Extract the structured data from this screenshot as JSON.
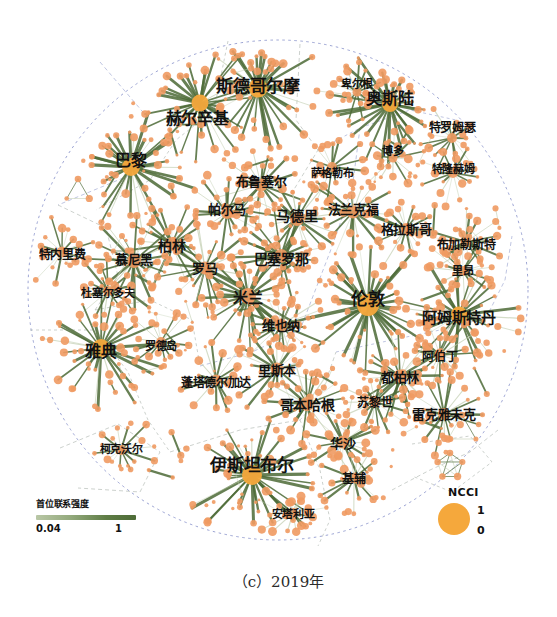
{
  "figure": {
    "caption": "（c）2019年",
    "circle": {
      "cx": 278,
      "cy": 290,
      "r": 250
    },
    "colors": {
      "node": "#ef9a62",
      "node_strong": "#f5a83c",
      "edge_strong": "#4d6b37",
      "edge_weak": "#c3cfb2",
      "boundary": "#7b86c4",
      "label": "#111111"
    }
  },
  "legend_edge": {
    "title": "首位联系强度",
    "min": "0.04",
    "max": "1"
  },
  "legend_node": {
    "title": "NCCI",
    "max": "1",
    "min": "0"
  },
  "chart_data": {
    "type": "scatter",
    "title": "（c）2019年",
    "xlabel": "",
    "ylabel": "",
    "grid": false,
    "legend_position": "bottom-left-and-bottom-right",
    "series": [
      {
        "name": "cities",
        "nodes": [
          {
            "label": "斯德哥尔摩",
            "x": 258,
            "y": 88,
            "r": 9.5,
            "ncci": 0.95,
            "lx": 258,
            "ly": 84
          },
          {
            "label": "赫尔辛基",
            "x": 200,
            "y": 103,
            "r": 8.5,
            "ncci": 0.88,
            "lx": 197,
            "ly": 117
          },
          {
            "label": "奥斯陆",
            "x": 390,
            "y": 104,
            "r": 8.0,
            "ncci": 0.85,
            "lx": 390,
            "ly": 97
          },
          {
            "label": "卑尔根",
            "x": 357,
            "y": 92,
            "r": 4.5,
            "ncci": 0.35,
            "lx": 357,
            "ly": 83
          },
          {
            "label": "特罗姆瑟",
            "x": 452,
            "y": 138,
            "r": 5.0,
            "ncci": 0.4,
            "lx": 452,
            "ly": 126
          },
          {
            "label": "博多",
            "x": 393,
            "y": 158,
            "r": 4.5,
            "ncci": 0.32,
            "lx": 393,
            "ly": 150
          },
          {
            "label": "特隆赫姆",
            "x": 453,
            "y": 173,
            "r": 5.0,
            "ncci": 0.38,
            "lx": 453,
            "ly": 168
          },
          {
            "label": "萨格勒布",
            "x": 332,
            "y": 167,
            "r": 5.0,
            "ncci": 0.38,
            "lx": 332,
            "ly": 172
          },
          {
            "label": "巴黎",
            "x": 131,
            "y": 167,
            "r": 9.0,
            "ncci": 0.92,
            "lx": 131,
            "ly": 159
          },
          {
            "label": "布鲁塞尔",
            "x": 261,
            "y": 185,
            "r": 6.5,
            "ncci": 0.55,
            "lx": 261,
            "ly": 180
          },
          {
            "label": "帕尔马",
            "x": 227,
            "y": 213,
            "r": 6.0,
            "ncci": 0.5,
            "lx": 227,
            "ly": 208
          },
          {
            "label": "马德里",
            "x": 297,
            "y": 219,
            "r": 7.0,
            "ncci": 0.65,
            "lx": 297,
            "ly": 215
          },
          {
            "label": "法兰克福",
            "x": 353,
            "y": 212,
            "r": 6.5,
            "ncci": 0.58,
            "lx": 353,
            "ly": 208
          },
          {
            "label": "格拉斯哥",
            "x": 406,
            "y": 229,
            "r": 6.0,
            "ncci": 0.5,
            "lx": 406,
            "ly": 228
          },
          {
            "label": "布加勒斯特",
            "x": 466,
            "y": 242,
            "r": 5.5,
            "ncci": 0.45,
            "lx": 466,
            "ly": 243
          },
          {
            "label": "柏林",
            "x": 172,
            "y": 244,
            "r": 7.0,
            "ncci": 0.62,
            "lx": 172,
            "ly": 245
          },
          {
            "label": "特内里费",
            "x": 62,
            "y": 252,
            "r": 5.5,
            "ncci": 0.42,
            "lx": 62,
            "ly": 253
          },
          {
            "label": "慕尼黑",
            "x": 134,
            "y": 261,
            "r": 7.0,
            "ncci": 0.6,
            "lx": 134,
            "ly": 258
          },
          {
            "label": "罗马",
            "x": 205,
            "y": 268,
            "r": 6.5,
            "ncci": 0.58,
            "lx": 205,
            "ly": 267
          },
          {
            "label": "巴塞罗那",
            "x": 281,
            "y": 256,
            "r": 7.0,
            "ncci": 0.62,
            "lx": 281,
            "ly": 258
          },
          {
            "label": "里昂",
            "x": 463,
            "y": 271,
            "r": 5.0,
            "ncci": 0.38,
            "lx": 463,
            "ly": 270
          },
          {
            "label": "杜塞尔多夫",
            "x": 108,
            "y": 291,
            "r": 5.0,
            "ncci": 0.38,
            "lx": 108,
            "ly": 292
          },
          {
            "label": "米兰",
            "x": 248,
            "y": 296,
            "r": 8.0,
            "ncci": 0.78,
            "lx": 248,
            "ly": 296
          },
          {
            "label": "伦敦",
            "x": 368,
            "y": 305,
            "r": 11.0,
            "ncci": 1.0,
            "lx": 368,
            "ly": 297
          },
          {
            "label": "阿姆斯特丹",
            "x": 459,
            "y": 315,
            "r": 8.5,
            "ncci": 0.82,
            "lx": 459,
            "ly": 316
          },
          {
            "label": "维也纳",
            "x": 281,
            "y": 325,
            "r": 6.5,
            "ncci": 0.58,
            "lx": 281,
            "ly": 324
          },
          {
            "label": "雅典",
            "x": 101,
            "y": 348,
            "r": 9.0,
            "ncci": 0.88,
            "lx": 101,
            "ly": 350
          },
          {
            "label": "罗德岛",
            "x": 161,
            "y": 342,
            "r": 5.0,
            "ncci": 0.35,
            "lx": 161,
            "ly": 345
          },
          {
            "label": "阿伯丁",
            "x": 440,
            "y": 355,
            "r": 5.5,
            "ncci": 0.45,
            "lx": 440,
            "ly": 355
          },
          {
            "label": "里斯本",
            "x": 277,
            "y": 369,
            "r": 6.5,
            "ncci": 0.58,
            "lx": 277,
            "ly": 369
          },
          {
            "label": "蓬塔德尔加达",
            "x": 216,
            "y": 380,
            "r": 5.5,
            "ncci": 0.42,
            "lx": 216,
            "ly": 381
          },
          {
            "label": "都柏林",
            "x": 400,
            "y": 376,
            "r": 6.5,
            "ncci": 0.58,
            "lx": 400,
            "ly": 376
          },
          {
            "label": "哥本哈根",
            "x": 307,
            "y": 404,
            "r": 7.0,
            "ncci": 0.62,
            "lx": 307,
            "ly": 404
          },
          {
            "label": "苏黎世",
            "x": 375,
            "y": 402,
            "r": 5.5,
            "ncci": 0.45,
            "lx": 375,
            "ly": 401
          },
          {
            "label": "雷克雅未克",
            "x": 444,
            "y": 414,
            "r": 6.0,
            "ncci": 0.5,
            "lx": 444,
            "ly": 413
          },
          {
            "label": "华沙",
            "x": 343,
            "y": 442,
            "r": 6.5,
            "ncci": 0.55,
            "lx": 343,
            "ly": 442
          },
          {
            "label": "柯克沃尔",
            "x": 121,
            "y": 450,
            "r": 5.0,
            "ncci": 0.35,
            "lx": 121,
            "ly": 448
          },
          {
            "label": "伊斯坦布尔",
            "x": 252,
            "y": 475,
            "r": 10.0,
            "ncci": 0.96,
            "lx": 252,
            "ly": 463
          },
          {
            "label": "基辅",
            "x": 354,
            "y": 478,
            "r": 5.5,
            "ncci": 0.45,
            "lx": 354,
            "ly": 477
          },
          {
            "label": "安塔利亚",
            "x": 293,
            "y": 513,
            "r": 5.0,
            "ncci": 0.38,
            "lx": 293,
            "ly": 513
          }
        ]
      }
    ]
  }
}
